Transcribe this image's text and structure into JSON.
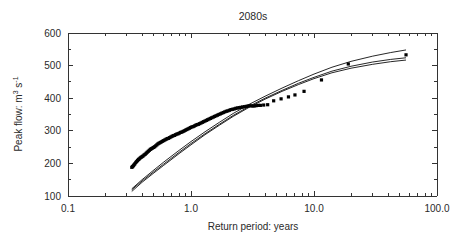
{
  "chart_data": {
    "type": "scatter",
    "title": "2080s",
    "xlabel": "Return period: years",
    "ylabel_parts": {
      "main": "Peak flow: m",
      "sup1": "3",
      "mid": " s",
      "sup2": "-1"
    },
    "ylabel": "Peak flow: m3 s-1",
    "xscale": "log",
    "yscale": "linear",
    "xlim": [
      0.1,
      100.0
    ],
    "ylim": [
      100,
      600
    ],
    "grid": false,
    "legend": null,
    "xticks": [
      0.1,
      1.0,
      10.0,
      100.0
    ],
    "xticklabels": [
      "0.1",
      "1.0",
      "10.0",
      "100.0"
    ],
    "yticks": [
      100,
      200,
      300,
      400,
      500,
      600
    ],
    "yticklabels": [
      "100",
      "200",
      "300",
      "400",
      "500",
      "600"
    ],
    "yminorticks": [
      150,
      250,
      350,
      450,
      550
    ],
    "series": [
      {
        "name": "observed peak flows",
        "type": "scatter",
        "marker": "square",
        "color": "#000000",
        "points": [
          [
            0.33,
            188
          ],
          [
            0.335,
            190
          ],
          [
            0.34,
            193
          ],
          [
            0.345,
            196
          ],
          [
            0.35,
            199
          ],
          [
            0.356,
            203
          ],
          [
            0.362,
            206
          ],
          [
            0.368,
            209
          ],
          [
            0.374,
            212
          ],
          [
            0.38,
            214
          ],
          [
            0.387,
            217
          ],
          [
            0.394,
            219
          ],
          [
            0.401,
            221
          ],
          [
            0.408,
            223
          ],
          [
            0.416,
            226
          ],
          [
            0.424,
            228
          ],
          [
            0.432,
            231
          ],
          [
            0.44,
            234
          ],
          [
            0.449,
            237
          ],
          [
            0.458,
            240
          ],
          [
            0.467,
            243
          ],
          [
            0.476,
            245
          ],
          [
            0.486,
            247
          ],
          [
            0.496,
            249
          ],
          [
            0.506,
            251
          ],
          [
            0.517,
            254
          ],
          [
            0.528,
            257
          ],
          [
            0.539,
            260
          ],
          [
            0.55,
            262
          ],
          [
            0.562,
            264
          ],
          [
            0.574,
            266
          ],
          [
            0.587,
            268
          ],
          [
            0.6,
            270
          ],
          [
            0.613,
            272
          ],
          [
            0.627,
            274
          ],
          [
            0.641,
            276
          ],
          [
            0.655,
            277
          ],
          [
            0.67,
            279
          ],
          [
            0.685,
            281
          ],
          [
            0.701,
            283
          ],
          [
            0.717,
            285
          ],
          [
            0.733,
            286
          ],
          [
            0.75,
            288
          ],
          [
            0.768,
            290
          ],
          [
            0.786,
            291
          ],
          [
            0.804,
            293
          ],
          [
            0.823,
            295
          ],
          [
            0.842,
            296
          ],
          [
            0.862,
            298
          ],
          [
            0.882,
            300
          ],
          [
            0.903,
            302
          ],
          [
            0.925,
            304
          ],
          [
            0.947,
            306
          ],
          [
            0.97,
            308
          ],
          [
            0.993,
            310
          ],
          [
            1.017,
            312
          ],
          [
            1.042,
            313
          ],
          [
            1.067,
            315
          ],
          [
            1.093,
            317
          ],
          [
            1.12,
            319
          ],
          [
            1.148,
            320
          ],
          [
            1.177,
            322
          ],
          [
            1.206,
            324
          ],
          [
            1.236,
            326
          ],
          [
            1.268,
            328
          ],
          [
            1.3,
            330
          ],
          [
            1.333,
            332
          ],
          [
            1.367,
            334
          ],
          [
            1.402,
            336
          ],
          [
            1.438,
            338
          ],
          [
            1.476,
            340
          ],
          [
            1.515,
            342
          ],
          [
            1.555,
            344
          ],
          [
            1.597,
            346
          ],
          [
            1.64,
            348
          ],
          [
            1.685,
            350
          ],
          [
            1.732,
            352
          ],
          [
            1.78,
            354
          ],
          [
            1.83,
            356
          ],
          [
            1.882,
            358
          ],
          [
            1.936,
            360
          ],
          [
            1.992,
            361
          ],
          [
            2.051,
            363
          ],
          [
            2.112,
            365
          ],
          [
            2.176,
            366
          ],
          [
            2.243,
            367
          ],
          [
            2.313,
            369
          ],
          [
            2.386,
            370
          ],
          [
            2.463,
            371
          ],
          [
            2.544,
            372
          ],
          [
            2.629,
            373
          ],
          [
            2.719,
            374
          ],
          [
            2.813,
            375
          ],
          [
            2.913,
            376
          ],
          [
            3.019,
            377
          ],
          [
            3.132,
            376
          ],
          [
            3.252,
            376
          ],
          [
            3.38,
            377
          ],
          [
            3.517,
            378
          ],
          [
            3.664,
            378
          ],
          [
            3.9,
            379
          ],
          [
            4.2,
            380
          ],
          [
            4.7,
            392
          ],
          [
            5.4,
            398
          ],
          [
            6.2,
            404
          ],
          [
            7.0,
            410
          ],
          [
            8.3,
            421
          ],
          [
            11.5,
            456
          ],
          [
            19.0,
            505
          ],
          [
            56.0,
            533
          ]
        ]
      },
      {
        "name": "fit upper",
        "type": "line",
        "color": "#000000",
        "points": [
          [
            0.33,
            122
          ],
          [
            0.4,
            150
          ],
          [
            0.5,
            180
          ],
          [
            0.6,
            204
          ],
          [
            0.8,
            240
          ],
          [
            1.0,
            267
          ],
          [
            1.3,
            297
          ],
          [
            1.7,
            326
          ],
          [
            2.2,
            353
          ],
          [
            3.0,
            382
          ],
          [
            4.0,
            406
          ],
          [
            5.5,
            431
          ],
          [
            7.5,
            454
          ],
          [
            10.0,
            474
          ],
          [
            14.0,
            495
          ],
          [
            20.0,
            513
          ],
          [
            30.0,
            529
          ],
          [
            42.0,
            540
          ],
          [
            56.0,
            548
          ]
        ]
      },
      {
        "name": "fit middle",
        "type": "line",
        "color": "#000000",
        "points": [
          [
            0.33,
            119
          ],
          [
            0.4,
            146
          ],
          [
            0.5,
            175
          ],
          [
            0.6,
            198
          ],
          [
            0.8,
            234
          ],
          [
            1.0,
            261
          ],
          [
            1.3,
            291
          ],
          [
            1.7,
            320
          ],
          [
            2.2,
            347
          ],
          [
            3.0,
            376
          ],
          [
            4.0,
            400
          ],
          [
            5.5,
            424
          ],
          [
            7.5,
            446
          ],
          [
            10.0,
            464
          ],
          [
            14.0,
            483
          ],
          [
            20.0,
            498
          ],
          [
            30.0,
            511
          ],
          [
            42.0,
            519
          ],
          [
            56.0,
            524
          ]
        ]
      },
      {
        "name": "fit lower",
        "type": "line",
        "color": "#000000",
        "points": [
          [
            0.33,
            114
          ],
          [
            0.4,
            142
          ],
          [
            0.5,
            171
          ],
          [
            0.6,
            194
          ],
          [
            0.8,
            230
          ],
          [
            1.0,
            257
          ],
          [
            1.3,
            288
          ],
          [
            1.7,
            317
          ],
          [
            2.2,
            344
          ],
          [
            3.0,
            373
          ],
          [
            4.0,
            397
          ],
          [
            5.5,
            421
          ],
          [
            7.5,
            442
          ],
          [
            10.0,
            460
          ],
          [
            14.0,
            478
          ],
          [
            20.0,
            492
          ],
          [
            30.0,
            504
          ],
          [
            42.0,
            512
          ],
          [
            56.0,
            517
          ]
        ]
      }
    ]
  }
}
